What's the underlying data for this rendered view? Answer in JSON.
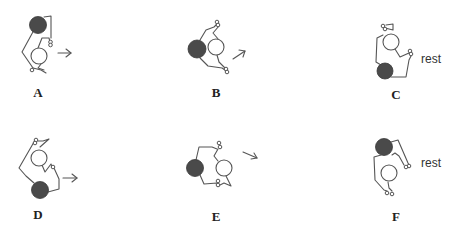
{
  "figure": {
    "panels": [
      {
        "id": "A",
        "label": "A",
        "motion": "arrow-right",
        "annotation": ""
      },
      {
        "id": "B",
        "label": "B",
        "motion": "arrow-up-right",
        "annotation": ""
      },
      {
        "id": "C",
        "label": "C",
        "motion": "none",
        "annotation": "rest"
      },
      {
        "id": "D",
        "label": "D",
        "motion": "arrow-right",
        "annotation": ""
      },
      {
        "id": "E",
        "label": "E",
        "motion": "arrow-down-right",
        "annotation": ""
      },
      {
        "id": "F",
        "label": "F",
        "motion": "none",
        "annotation": "rest"
      }
    ]
  },
  "colors": {
    "dark_figure": "#4a4a4a",
    "light_figure": "#ffffff",
    "stroke": "#555555"
  }
}
